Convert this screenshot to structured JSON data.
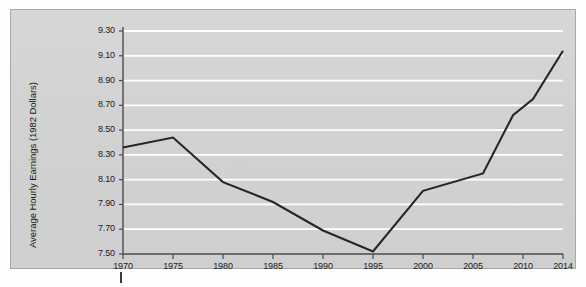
{
  "figure": {
    "background_color": "#fdfdfd",
    "plot_background_color": "#d4d4d4",
    "gridline_color": "#ffffff",
    "line_color": "#262626",
    "axis_color": "#4a4a4a",
    "text_color": "#1b1b1b"
  },
  "chart_data": {
    "type": "line",
    "title": "",
    "subtitle": "",
    "xlabel": "",
    "ylabel": "Average Hourly Earnings (1982 Dollars)",
    "xlim": [
      1970,
      2014
    ],
    "ylim": [
      7.5,
      9.3
    ],
    "ytick_step": 0.2,
    "grid": true,
    "grid_axis": "y",
    "legend": false,
    "legend_position": "none",
    "x_tick_labels": [
      "1970",
      "1975",
      "1980",
      "1985",
      "1990",
      "1995",
      "2000",
      "2005",
      "2010",
      "2014"
    ],
    "x_ticks": [
      1970,
      1975,
      1980,
      1985,
      1990,
      1995,
      2000,
      2005,
      2010,
      2014
    ],
    "y_tick_labels": [
      "9.30",
      "9.10",
      "8.90",
      "8.70",
      "8.50",
      "8.30",
      "8.10",
      "7.90",
      "7.70",
      "7.50"
    ],
    "y_ticks": [
      9.3,
      9.1,
      8.9,
      8.7,
      8.5,
      8.3,
      8.1,
      7.9,
      7.7,
      7.5
    ],
    "series": [
      {
        "name": "Average Hourly Earnings",
        "x": [
          1970,
          1975,
          1980,
          1985,
          1990,
          1995,
          2000,
          2006,
          2009,
          2011,
          2014
        ],
        "values": [
          8.36,
          8.44,
          8.08,
          7.92,
          7.69,
          7.52,
          8.01,
          8.15,
          8.62,
          8.75,
          9.14
        ]
      }
    ],
    "annotations": []
  }
}
